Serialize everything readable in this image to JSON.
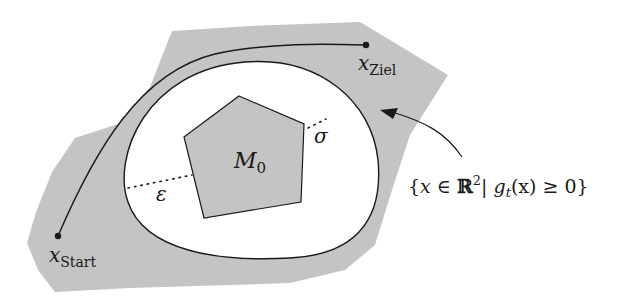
{
  "diagram": {
    "region_label": {
      "open_brace": "{",
      "x": "x",
      "in": " ∈ ",
      "reals": "ℝ",
      "sup": "2",
      "bar": "| ",
      "g": "g",
      "sub_t": "t",
      "paren_x": "(x)",
      "ge": " ≥ 0",
      "close_brace": "}"
    },
    "obstacle_label": {
      "main": "M",
      "sub": "0"
    },
    "epsilon_label": "ε",
    "sigma_label": "σ",
    "start_label": {
      "main": "x",
      "sub": "Start"
    },
    "goal_label": {
      "main": "x",
      "sub": "Ziel"
    },
    "colors": {
      "region_fill": "#c4c4c4",
      "obstacle_fill": "#c4c4c4",
      "line": "#1a1a1a",
      "background": "#ffffff"
    }
  }
}
